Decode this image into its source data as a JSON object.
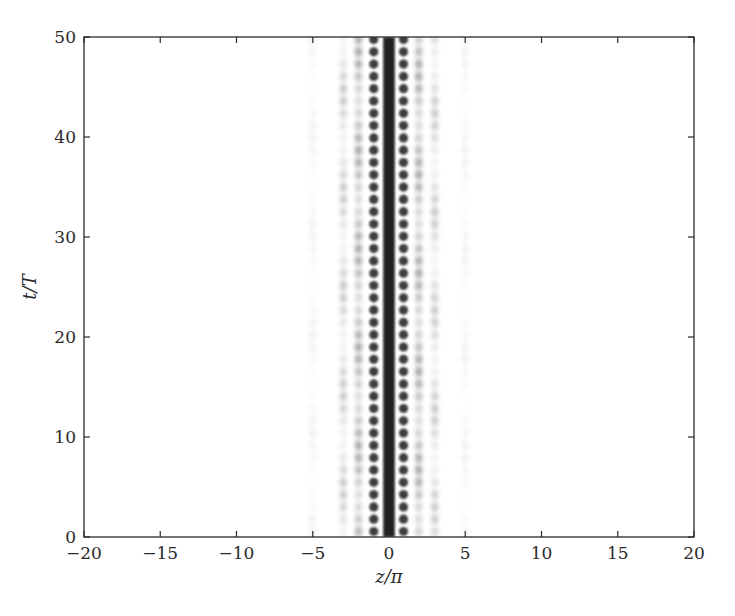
{
  "chart_data": {
    "type": "heatmap",
    "title": "",
    "xlabel": "z/π",
    "ylabel": "t/T",
    "xlim": [
      -20,
      20
    ],
    "ylim": [
      0,
      50
    ],
    "xticks": [
      -20,
      -15,
      -10,
      -5,
      0,
      5,
      10,
      15,
      20
    ],
    "yticks": [
      0,
      10,
      20,
      30,
      40,
      50
    ],
    "xtick_labels": [
      "−20",
      "−15",
      "−10",
      "−5",
      "0",
      "5",
      "10",
      "15",
      "20"
    ],
    "ytick_labels": [
      "0",
      "10",
      "20",
      "30",
      "40",
      "50"
    ],
    "colormap": "grayscale (dark = high intensity)",
    "grid": false,
    "legend": null,
    "features": {
      "central_stripe": {
        "z_center": 0.0,
        "z_halfwidth": 0.38,
        "intensity": 0.95
      },
      "dot_columns": [
        {
          "z": -1.0,
          "intensity": 0.85,
          "period_t": 1.23,
          "modulation": 0.0
        },
        {
          "z": 0.95,
          "intensity": 0.85,
          "period_t": 1.23,
          "modulation": 0.0
        },
        {
          "z": -2.0,
          "intensity": 0.45,
          "period_t": 1.23,
          "modulation": 0.6
        },
        {
          "z": 1.95,
          "intensity": 0.45,
          "period_t": 1.23,
          "modulation": 0.6
        },
        {
          "z": -3.0,
          "intensity": 0.28,
          "period_t": 1.23,
          "modulation": 0.8
        },
        {
          "z": 3.0,
          "intensity": 0.28,
          "period_t": 1.23,
          "modulation": 0.8
        },
        {
          "z": -5.0,
          "intensity": 0.07,
          "period_t": 1.23,
          "modulation": 0.9
        },
        {
          "z": 5.0,
          "intensity": 0.07,
          "period_t": 1.23,
          "modulation": 0.9
        }
      ]
    }
  },
  "plot_area": {
    "left": 84,
    "top": 37,
    "right": 694,
    "bottom": 537
  },
  "colors": {
    "ink": "#2a2a2a",
    "background": "#ffffff",
    "dot": "#1a1a1a"
  }
}
